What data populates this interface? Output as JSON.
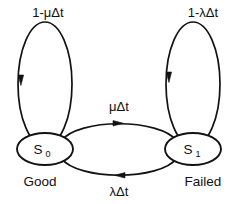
{
  "diagram": {
    "type": "markov-state-transition-diagram",
    "title": "",
    "stroke_color": "#121212",
    "background_color": "#ffffff",
    "states": [
      {
        "id": "S0",
        "symbol": "S",
        "subscript": "0",
        "name": "Good",
        "position": "left"
      },
      {
        "id": "S1",
        "symbol": "S",
        "subscript": "1",
        "name": "Failed",
        "position": "right"
      }
    ],
    "transitions": [
      {
        "id": "self-loop-s0",
        "from": "S0",
        "to": "S0",
        "label": "1-μΔt",
        "label_position": "top-left",
        "shape": "self-loop-ellipse",
        "arrow_direction": "down"
      },
      {
        "id": "self-loop-s1",
        "from": "S1",
        "to": "S1",
        "label": "1-λΔt",
        "label_position": "top-right",
        "shape": "self-loop-ellipse",
        "arrow_direction": "down"
      },
      {
        "id": "s0-to-s1",
        "from": "S0",
        "to": "S1",
        "label": "μΔt",
        "label_position": "center-upper",
        "shape": "arc-upper",
        "arrow_direction": "right"
      },
      {
        "id": "s1-to-s0",
        "from": "S1",
        "to": "S0",
        "label": "λΔt",
        "label_position": "center-lower",
        "shape": "arc-lower",
        "arrow_direction": "left"
      }
    ],
    "labels": {
      "loop_left": "1-μΔt",
      "loop_right": "1-λΔt",
      "edge_top": "μΔt",
      "edge_bottom": "λΔt",
      "state_left_symbol": "S",
      "state_left_sub": "0",
      "state_right_symbol": "S",
      "state_right_sub": "1",
      "state_left_name": "Good",
      "state_right_name": "Failed"
    }
  }
}
